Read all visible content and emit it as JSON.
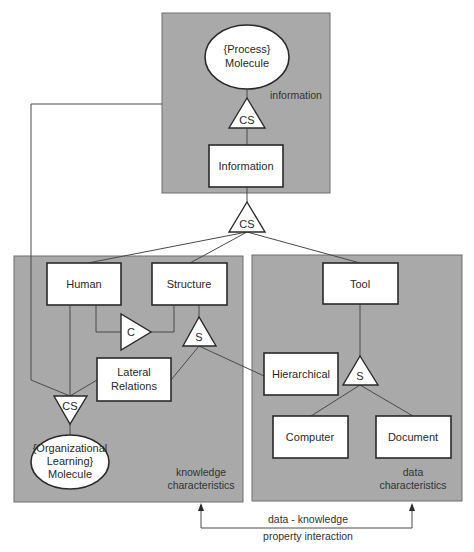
{
  "diagram": {
    "panels": {
      "top": {
        "note": "information"
      },
      "left": {
        "note_line1": "knowledge",
        "note_line2": "characteristics"
      },
      "right": {
        "note_line1": "data",
        "note_line2": "characteristics"
      }
    },
    "nodes": {
      "process_molecule": {
        "line1": "{Process}",
        "line2": "Molecule"
      },
      "information": {
        "label": "Information"
      },
      "human": {
        "label": "Human"
      },
      "structure": {
        "label": "Structure"
      },
      "lateral_relations": {
        "line1": "Lateral",
        "line2": "Relations"
      },
      "org_learning_molecule": {
        "line1": "{Organizational",
        "line2": "Learning}",
        "line3": "Molecule"
      },
      "tool": {
        "label": "Tool"
      },
      "hierarchical": {
        "label": "Hierarchical"
      },
      "computer": {
        "label": "Computer"
      },
      "document": {
        "label": "Document"
      }
    },
    "connectors": {
      "cs_top": "CS",
      "cs_middle": "CS",
      "cs_left": "CS",
      "c_left": "C",
      "s_left": "S",
      "s_right": "S"
    },
    "interaction": {
      "line1": "data - knowledge",
      "line2": "property interaction"
    },
    "colors": {
      "panel": "#a9a9a9",
      "box": "#ffffff",
      "stroke": "#2a2a2a"
    }
  }
}
